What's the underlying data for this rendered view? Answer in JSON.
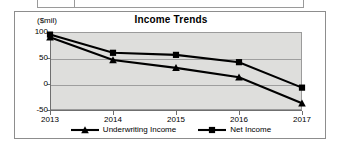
{
  "document": {
    "top_table_strip": {
      "visible": true,
      "cells": [
        "",
        ""
      ]
    }
  },
  "chart_data": {
    "type": "line",
    "title": "Income Trends",
    "xlabel": "",
    "ylabel": "($mil)",
    "categories": [
      "2013",
      "2014",
      "2015",
      "2016",
      "2017"
    ],
    "ylim": [
      -50,
      100
    ],
    "yticks": [
      100,
      50,
      0,
      -50
    ],
    "ytick_labels": [
      "100",
      "50",
      "0",
      "-50"
    ],
    "grid": true,
    "legend_position": "bottom",
    "plot_background": "#dededc",
    "series": [
      {
        "name": "Underwriting Income",
        "marker": "triangle",
        "color": "#000000",
        "values": [
          90,
          46,
          31,
          13,
          -37
        ]
      },
      {
        "name": "Net Income",
        "marker": "square",
        "color": "#000000",
        "values": [
          95,
          60,
          56,
          42,
          -7
        ]
      }
    ]
  }
}
